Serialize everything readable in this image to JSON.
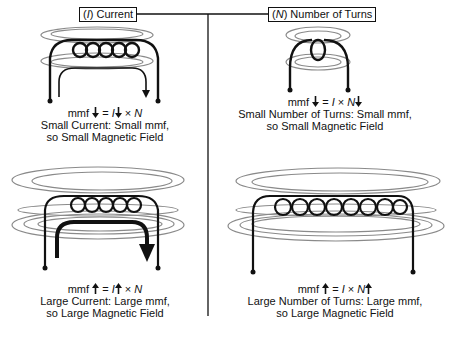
{
  "header": {
    "current_label_var": "I",
    "current_label_text": "Current",
    "turns_label_var": "N",
    "turns_label_text": "Number of Turns"
  },
  "panels": {
    "small_current": {
      "eq_mmf": "mmf",
      "eq_equals": "=",
      "eq_I": "I",
      "eq_times": "×",
      "eq_N": "N",
      "mmf_arrow": "down",
      "I_arrow": "down",
      "N_arrow": "none",
      "line1": "Small Current: Small mmf,",
      "line2": "so Small Magnetic Field",
      "turns": 5
    },
    "small_turns": {
      "eq_mmf": "mmf",
      "eq_equals": "=",
      "eq_I": "I",
      "eq_times": "×",
      "eq_N": "N",
      "mmf_arrow": "down",
      "I_arrow": "none",
      "N_arrow": "down",
      "line1": "Small Number of Turns: Small mmf,",
      "line2": "so Small Magnetic Field",
      "turns": 1
    },
    "large_current": {
      "eq_mmf": "mmf",
      "eq_equals": "=",
      "eq_I": "I",
      "eq_times": "×",
      "eq_N": "N",
      "mmf_arrow": "up",
      "I_arrow": "up",
      "N_arrow": "none",
      "line1": "Large Current: Large mmf,",
      "line2": "so Large Magnetic Field",
      "turns": 5
    },
    "large_turns": {
      "eq_mmf": "mmf",
      "eq_equals": "=",
      "eq_I": "I",
      "eq_times": "×",
      "eq_N": "N",
      "mmf_arrow": "up",
      "I_arrow": "none",
      "N_arrow": "up",
      "line1": "Large Number of Turns: Large mmf,",
      "line2": "so Large Magnetic Field",
      "turns": 8
    }
  },
  "colors": {
    "ink": "#111111",
    "field_lines": "#8a8a8a",
    "background": "#ffffff"
  }
}
